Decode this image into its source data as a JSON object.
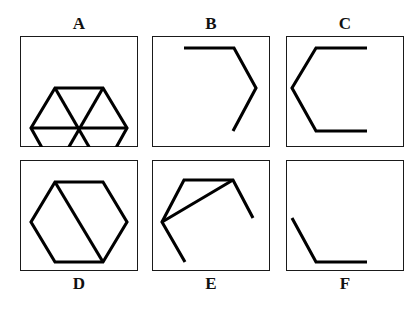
{
  "figure": {
    "background_color": "#ffffff",
    "stroke_color": "#000000",
    "frame_color": "#1a1a1a",
    "canvas": {
      "width": 415,
      "height": 309
    },
    "panels": [
      {
        "id": "A",
        "label": "A",
        "label_position": "top",
        "box": {
          "x": 20,
          "y": 36,
          "width": 118,
          "height": 111
        },
        "shape_name": "hexagon-with-three-diagonals",
        "shape_description": "Complete hexagon with three full diagonals meeting at the center, forming six triangles",
        "vertices": [
          [
            35,
            52
          ],
          [
            83,
            52
          ],
          [
            107,
            92
          ],
          [
            83,
            135
          ],
          [
            35,
            135
          ],
          [
            11,
            92
          ]
        ],
        "paths": [
          "M 35 52 L 83 52 L 107 92 L 83 135 L 35 135 L 11 92 Z",
          "M 35 52 L 83 135",
          "M 83 52 L 35 135",
          "M 11 92 L 107 92"
        ]
      },
      {
        "id": "B",
        "label": "B",
        "label_position": "top",
        "box": {
          "x": 152,
          "y": 36,
          "width": 118,
          "height": 111
        },
        "shape_name": "partial-hexagon-three-segments",
        "shape_description": "Three connected hexagon edges: top edge, upper-right edge, lower-right edge, open on the left",
        "paths": [
          "M 32 12 L 82 12 L 104 52 L 81 95"
        ]
      },
      {
        "id": "C",
        "label": "C",
        "label_position": "top",
        "box": {
          "x": 286,
          "y": 36,
          "width": 118,
          "height": 111
        },
        "shape_name": "partial-hexagon-four-segments",
        "shape_description": "Four connected hexagon edges forming a C shape open on the right: top, upper-left, lower-left, bottom",
        "paths": [
          "M 81 12 L 30 12 L 6 52 L 30 95 L 81 95"
        ]
      },
      {
        "id": "D",
        "label": "D",
        "label_position": "bottom",
        "box": {
          "x": 20,
          "y": 160,
          "width": 118,
          "height": 111
        },
        "shape_name": "hexagon-with-one-diagonal",
        "shape_description": "Complete hexagon with a single long diagonal from the top-left vertex to the bottom-right vertex",
        "vertices": [
          [
            35,
            22
          ],
          [
            83,
            22
          ],
          [
            107,
            62
          ],
          [
            83,
            102
          ],
          [
            35,
            102
          ],
          [
            11,
            62
          ]
        ],
        "paths": [
          "M 35 22 L 83 22 L 107 62 L 83 102 L 35 102 L 11 62 Z",
          "M 35 22 L 83 102"
        ]
      },
      {
        "id": "E",
        "label": "E",
        "label_position": "bottom",
        "box": {
          "x": 152,
          "y": 160,
          "width": 118,
          "height": 111
        },
        "shape_name": "rotated-partial-hexagon-with-diagonal",
        "shape_description": "Rotated partial hexagon: four connected edges plus a diagonal from the left vertex to the upper-right vertex",
        "paths": [
          "M 33 102 L 10 62 L 32 20 L 81 20 L 101 58",
          "M 10 62 L 81 20"
        ]
      },
      {
        "id": "F",
        "label": "F",
        "label_position": "bottom",
        "box": {
          "x": 286,
          "y": 160,
          "width": 118,
          "height": 111
        },
        "shape_name": "partial-hexagon-two-segments",
        "shape_description": "Two connected hexagon edges: lower-left diagonal edge and bottom horizontal edge",
        "paths": [
          "M 6 58 L 30 102 L 81 102"
        ]
      }
    ]
  }
}
